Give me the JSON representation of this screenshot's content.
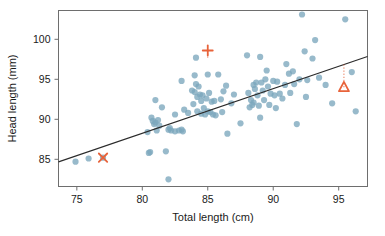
{
  "chart_data": {
    "type": "scatter",
    "title": "",
    "xlabel": "Total length (cm)",
    "ylabel": "Head length (mm)",
    "xlim": [
      73.6,
      97.2
    ],
    "ylim": [
      81.6,
      103.6
    ],
    "xticks": [
      75,
      80,
      85,
      90,
      95
    ],
    "yticks": [
      85,
      90,
      95,
      100
    ],
    "xtick_labels": [
      "75",
      "80",
      "85",
      "90",
      "95"
    ],
    "ytick_labels": [
      "85",
      "90",
      "95",
      "100"
    ],
    "grid": false,
    "legend": "none",
    "point_color": "#7ba7bc",
    "annotation_color": "#e8633a",
    "line_color": "#2b2b2b",
    "regression_line": {
      "x_start": 73.6,
      "y_start": 84.68,
      "x_end": 97.2,
      "y_end": 97.85,
      "slope": 0.558,
      "intercept": 43.62
    },
    "x": [
      74.9,
      75.9,
      77.0,
      80.4,
      80.5,
      80.6,
      80.7,
      80.8,
      80.9,
      81.0,
      81.0,
      81.1,
      81.2,
      81.3,
      81.5,
      81.8,
      82.0,
      82.0,
      82.1,
      82.2,
      82.5,
      82.5,
      82.8,
      83.0,
      83.0,
      83.1,
      83.2,
      83.5,
      83.8,
      83.9,
      84.0,
      84.0,
      84.1,
      84.1,
      84.2,
      84.2,
      84.3,
      84.4,
      84.5,
      84.5,
      84.6,
      84.7,
      84.8,
      84.9,
      85.0,
      85.0,
      85.1,
      85.2,
      85.3,
      85.4,
      85.5,
      85.6,
      85.8,
      86.0,
      86.1,
      86.2,
      86.4,
      86.5,
      86.8,
      87.0,
      87.5,
      88.0,
      88.1,
      88.2,
      88.3,
      88.4,
      88.5,
      88.5,
      88.6,
      88.7,
      88.8,
      88.9,
      89.0,
      89.0,
      89.1,
      89.2,
      89.3,
      89.4,
      89.5,
      89.6,
      89.7,
      89.8,
      90.0,
      90.1,
      90.2,
      90.3,
      90.5,
      90.7,
      90.9,
      91.0,
      91.2,
      91.3,
      91.5,
      91.6,
      91.8,
      92.0,
      92.2,
      92.4,
      92.5,
      92.6,
      93.0,
      93.2,
      93.5,
      94.0,
      94.5,
      95.5,
      96.0,
      96.3
    ],
    "y": [
      84.7,
      85.1,
      85.2,
      88.4,
      85.8,
      85.9,
      90.2,
      89.8,
      89.4,
      92.4,
      89.6,
      88.6,
      89.9,
      89.2,
      91.5,
      86.0,
      82.5,
      88.7,
      88.9,
      88.6,
      90.6,
      88.5,
      88.6,
      94.8,
      88.7,
      88.5,
      91.2,
      90.8,
      93.6,
      91.9,
      95.5,
      93.4,
      97.7,
      94.4,
      92.8,
      91.0,
      94.1,
      93.1,
      92.3,
      90.7,
      93.0,
      91.4,
      90.6,
      92.6,
      95.6,
      91.0,
      93.3,
      90.9,
      92.2,
      90.6,
      92.3,
      90.5,
      95.6,
      92.5,
      90.9,
      93.5,
      94.2,
      88.2,
      92.0,
      93.1,
      89.5,
      98.0,
      93.3,
      91.5,
      92.4,
      91.8,
      94.3,
      92.1,
      93.8,
      94.6,
      93.0,
      91.7,
      97.8,
      90.2,
      94.6,
      93.6,
      92.4,
      95.0,
      96.1,
      94.1,
      91.8,
      93.2,
      94.8,
      93.0,
      91.4,
      94.7,
      93.2,
      92.6,
      94.3,
      96.9,
      95.7,
      93.3,
      96.0,
      94.4,
      89.4,
      95.0,
      103.1,
      98.5,
      92.8,
      94.9,
      97.6,
      99.9,
      95.2,
      94.3,
      92.0,
      102.5,
      95.9,
      91.0
    ],
    "annotations": [
      {
        "name": "outlier-cross",
        "marker": "x",
        "x": 77.0,
        "y": 85.2,
        "residual_to_line": 0.41
      },
      {
        "name": "outlier-plus",
        "marker": "plus",
        "x": 85.0,
        "y": 98.6,
        "residual_to_line": 7.55,
        "residual_line_from_y": 97.7
      },
      {
        "name": "outlier-triangle",
        "marker": "triangle",
        "x": 95.4,
        "y": 94.0,
        "residual_to_line": -2.85,
        "residual_line_from_y": 96.85
      }
    ]
  }
}
